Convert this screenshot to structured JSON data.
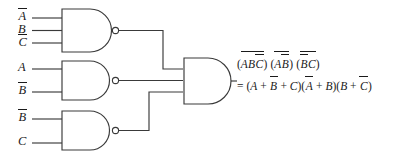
{
  "diagram": {
    "type": "logic-circuit",
    "gate_count": 4
  },
  "gates": [
    {
      "id": "nand-gate-1",
      "kind": "NAND",
      "inputs": [
        "A-bar",
        "B",
        "C-bar"
      ],
      "x": 60,
      "y": 8,
      "w": 55,
      "h": 44
    },
    {
      "id": "nand-gate-2",
      "kind": "NAND",
      "inputs": [
        "A",
        "B-bar"
      ],
      "x": 60,
      "y": 60,
      "w": 55,
      "h": 40
    },
    {
      "id": "nand-gate-3",
      "kind": "NAND",
      "inputs": [
        "B-bar",
        "C"
      ],
      "x": 60,
      "y": 110,
      "w": 55,
      "h": 40
    },
    {
      "id": "and-gate-output",
      "kind": "AND",
      "inputs": [
        "nand-1-out",
        "nand-2-out",
        "nand-3-out"
      ],
      "x": 183,
      "y": 58,
      "w": 48,
      "h": 46
    }
  ],
  "inputs": [
    {
      "name": "input-a-bar-gate1",
      "letter": "A",
      "bar": true,
      "x": 18,
      "y": 15
    },
    {
      "name": "input-b-gate1",
      "letter": "B",
      "bar": false,
      "x": 18,
      "y": 27
    },
    {
      "name": "input-c-bar-gate1",
      "letter": "C",
      "bar": true,
      "x": 18,
      "y": 40
    },
    {
      "name": "input-a-gate2",
      "letter": "A",
      "bar": false,
      "x": 18,
      "y": 64
    },
    {
      "name": "input-b-bar-gate2",
      "letter": "B",
      "bar": true,
      "x": 18,
      "y": 88
    },
    {
      "name": "input-b-bar-gate3",
      "letter": "B",
      "bar": true,
      "x": 18,
      "y": 115
    },
    {
      "name": "input-c-gate3",
      "letter": "C",
      "bar": false,
      "x": 18,
      "y": 139
    }
  ],
  "expression": {
    "line1": {
      "term1": {
        "vars": [
          "A",
          "B",
          "C"
        ],
        "inner_bars": [
          false,
          false,
          true
        ],
        "group_bar": true
      },
      "term2": {
        "vars": [
          "A",
          "B"
        ],
        "inner_bars": [
          false,
          true
        ],
        "group_bar": true
      },
      "term3": {
        "vars": [
          "B",
          "C"
        ],
        "inner_bars": [
          false,
          true
        ],
        "group_bar": true
      },
      "text": "(ABC̄)(AB̄)(B̄C)"
    },
    "line2": {
      "equals": "=",
      "factor1": {
        "terms": [
          "A",
          "B",
          "C"
        ],
        "bars": [
          false,
          true,
          false
        ],
        "op": "+"
      },
      "factor2": {
        "terms": [
          "A",
          "B"
        ],
        "bars": [
          true,
          false
        ],
        "op": "+"
      },
      "factor3": {
        "terms": [
          "B",
          "C"
        ],
        "bars": [
          false,
          true
        ],
        "op": "+"
      },
      "text": "= (A + B̄ + C)(Ā + B)(B + C̄)"
    }
  },
  "style": {
    "line_color": "#3a3a3a",
    "text_color": "#1a1a1a",
    "background": "#ffffff"
  }
}
